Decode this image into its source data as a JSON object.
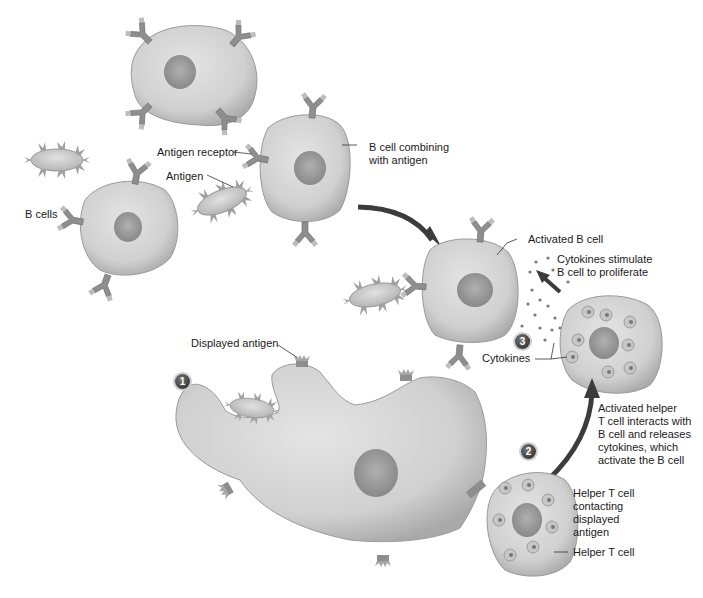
{
  "diagram": {
    "type": "biological illustration",
    "colors": {
      "background": "#ffffff",
      "cell_fill": "#d4d4d4",
      "cell_shadow": "#a8a8a8",
      "nucleus": "#9a9a9a",
      "receptor": "#8e8e8e",
      "arrow": "#3c3c3c",
      "step_badge": "#444444"
    }
  },
  "labels": {
    "b_cells": "B cells",
    "antigen_receptor": "Antigen receptor",
    "antigen": "Antigen",
    "b_cell_combining": "B cell combining\nwith antigen",
    "activated_b_cell": "Activated B cell",
    "cytokines_stimulate": "Cytokines stimulate\nB cell to proliferate",
    "cytokines": "Cytokines",
    "displayed_antigen": "Displayed antigen",
    "activated_helper": "Activated helper\nT cell interacts with\nB cell and releases\ncytokines, which\nactivate the B cell",
    "helper_contacting": "Helper T cell\ncontacting\ndisplayed\nantigen",
    "helper_t_cell": "Helper T cell"
  },
  "steps": [
    {
      "number": "1"
    },
    {
      "number": "2"
    },
    {
      "number": "3"
    }
  ]
}
